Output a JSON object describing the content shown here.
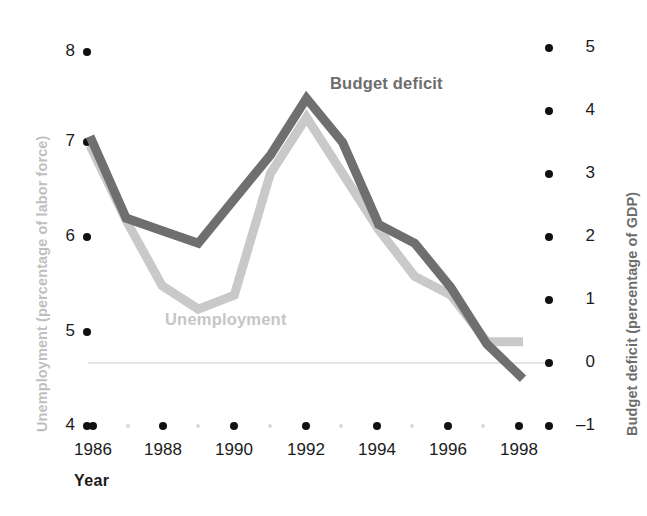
{
  "chart_data": {
    "type": "line",
    "title": "",
    "xlabel": "Year",
    "x": [
      1986,
      1987,
      1988,
      1989,
      1990,
      1991,
      1992,
      1993,
      1994,
      1995,
      1996,
      1997,
      1998
    ],
    "xlim": [
      1985.5,
      1998.9
    ],
    "xticks": [
      1986,
      1988,
      1990,
      1992,
      1994,
      1996,
      1998
    ],
    "xtick_labels": [
      "1986",
      "1988",
      "1990",
      "1992",
      "1994",
      "1996",
      "1998"
    ],
    "xminor_ticks": [
      1987,
      1989,
      1991,
      1993,
      1995,
      1997
    ],
    "grid": false,
    "legend": "inline-annotations",
    "zero_line": 0,
    "series": [
      {
        "name": "Unemployment",
        "axis": "left",
        "color": "#c9c9c9",
        "label_color": "#c6c6c6",
        "values": [
          7.0,
          6.2,
          5.5,
          5.25,
          5.4,
          6.7,
          7.3,
          6.7,
          6.1,
          5.6,
          5.4,
          4.9,
          4.9
        ]
      },
      {
        "name": "Budget deficit",
        "axis": "right",
        "color": "#6f6f6f",
        "label_color": "#6d6d6d",
        "values": [
          3.6,
          2.3,
          2.1,
          1.9,
          2.6,
          3.3,
          4.2,
          3.5,
          2.2,
          1.9,
          1.2,
          0.3,
          -0.25
        ]
      }
    ],
    "left_axis": {
      "label": "Unemployment (percentage of labor force)",
      "label_color": "#bfbfbf",
      "ylim": [
        4,
        8
      ],
      "ticks": [
        8,
        7,
        6,
        5,
        4
      ],
      "tick_labels": [
        "8",
        "7",
        "6",
        "5",
        "4"
      ]
    },
    "right_axis": {
      "label": "Budget deficit (percentage of GDP)",
      "label_color": "#6d6d6d",
      "ylim": [
        -1,
        5
      ],
      "ticks": [
        5,
        4,
        3,
        2,
        1,
        0,
        -1
      ],
      "tick_labels": [
        "5",
        "4",
        "3",
        "2",
        "1",
        "0",
        "–1"
      ]
    }
  },
  "axes": {
    "left_title": "Unemployment (percentage of labor force)",
    "right_title": "Budget deficit (percentage of GDP)",
    "x_title": "Year"
  },
  "left_ticks": [
    {
      "label": "8",
      "y": 52
    },
    {
      "label": "7",
      "y": 142
    },
    {
      "label": "6",
      "y": 237
    },
    {
      "label": "5",
      "y": 332
    },
    {
      "label": "4",
      "y": 426
    }
  ],
  "right_ticks": [
    {
      "label": "5",
      "y": 48
    },
    {
      "label": "4",
      "y": 111
    },
    {
      "label": "3",
      "y": 174
    },
    {
      "label": "2",
      "y": 237
    },
    {
      "label": "1",
      "y": 300
    },
    {
      "label": "0",
      "y": 363
    },
    {
      "label": "–1",
      "y": 426
    }
  ],
  "x_ticks": [
    {
      "label": "1986",
      "x": 93
    },
    {
      "label": "1988",
      "x": 163
    },
    {
      "label": "1990",
      "x": 234
    },
    {
      "label": "1992",
      "x": 306
    },
    {
      "label": "1994",
      "x": 377
    },
    {
      "label": "1996",
      "x": 448
    },
    {
      "label": "1998",
      "x": 519
    }
  ],
  "x_minor_ticks": [
    {
      "x": 128
    },
    {
      "x": 198
    },
    {
      "x": 270
    },
    {
      "x": 341
    },
    {
      "x": 412
    },
    {
      "x": 483
    }
  ],
  "series_labels": {
    "budget_deficit": "Budget deficit",
    "unemployment": "Unemployment"
  },
  "colors": {
    "unemployment_line": "#c9c9c9",
    "budget_deficit_line": "#6f6f6f",
    "zero_line": "#dcdcdc",
    "tick_dot": "#111111",
    "minor_tick_dot": "#d8d8d8",
    "text": "#1b1b1b"
  }
}
